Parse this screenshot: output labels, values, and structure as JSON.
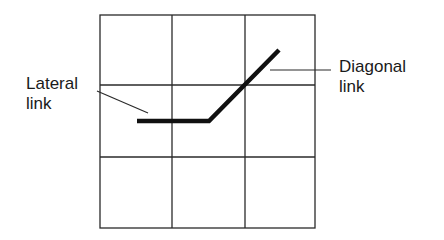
{
  "diagram": {
    "type": "grid-link-illustration",
    "grid": {
      "rows": 3,
      "columns": 3,
      "x_lines": [
        100,
        172,
        245,
        315
      ],
      "y_lines": [
        15,
        85,
        157,
        228
      ],
      "line_color": "#2a2a2a"
    },
    "path": {
      "color": "#111111",
      "segments": [
        {
          "name": "lateral",
          "from": [
            137,
            121
          ],
          "to": [
            209,
            121
          ]
        },
        {
          "name": "diagonal",
          "from": [
            209,
            121
          ],
          "to": [
            279,
            50
          ]
        }
      ]
    },
    "labels": {
      "lateral": {
        "line1": "Lateral",
        "line2": "link"
      },
      "diagonal": {
        "line1": "Diagonal",
        "line2": "link"
      }
    },
    "leaders": {
      "lateral": {
        "from": [
          97,
          91
        ],
        "to": [
          148,
          113
        ]
      },
      "diagonal": {
        "from": [
          270,
          70
        ],
        "to": [
          331,
          70
        ]
      }
    }
  }
}
